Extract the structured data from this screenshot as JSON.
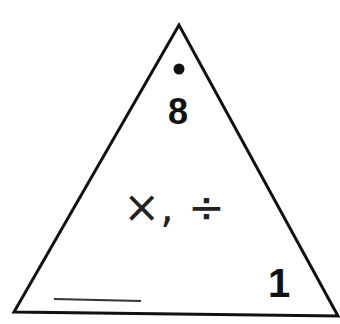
{
  "diagram": {
    "type": "fact-family-triangle",
    "top_value": "8",
    "top_marker": "dot",
    "center_operations": "×, ÷",
    "bottom_right_value": "1",
    "bottom_left_value": "",
    "bottom_left_blank": "answer line",
    "colors": {
      "stroke": "#111111",
      "background": "#ffffff"
    }
  }
}
